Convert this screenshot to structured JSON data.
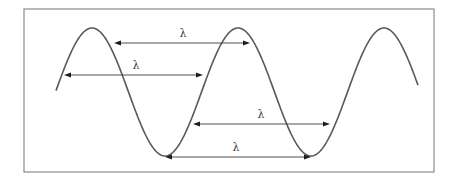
{
  "diagram": {
    "frame": {
      "x": 24,
      "y": 9,
      "width": 410,
      "height": 163
    },
    "wave": {
      "start_x": 56,
      "end_x": 418,
      "center_y": 92,
      "amplitude": 64,
      "period": 146,
      "first_peak_x": 92,
      "peaks_x": [
        92,
        238,
        384
      ],
      "troughs_x": [
        165,
        311
      ],
      "stroke_color": "#5a5a5a"
    },
    "arrows": [
      {
        "id": "crest-to-crest-offset",
        "y": 43,
        "x1": 114,
        "x2": 250,
        "label": "λ",
        "label_x": 183,
        "label_y": 37
      },
      {
        "id": "zero-crossing",
        "y": 75,
        "x1": 64,
        "x2": 203,
        "label": "λ",
        "label_x": 136,
        "label_y": 69
      },
      {
        "id": "lower-offset",
        "y": 124,
        "x1": 193,
        "x2": 330,
        "label": "λ",
        "label_x": 261,
        "label_y": 118
      },
      {
        "id": "trough-to-trough",
        "y": 157,
        "x1": 165,
        "x2": 311,
        "label": "λ",
        "label_x": 236,
        "label_y": 151
      }
    ],
    "colors": {
      "frame": "#8c8c8c",
      "arrow": "#3a3a3a",
      "arrowhead": "#1e1e1e",
      "label": "#3a3a3a",
      "background": "#ffffff"
    }
  }
}
